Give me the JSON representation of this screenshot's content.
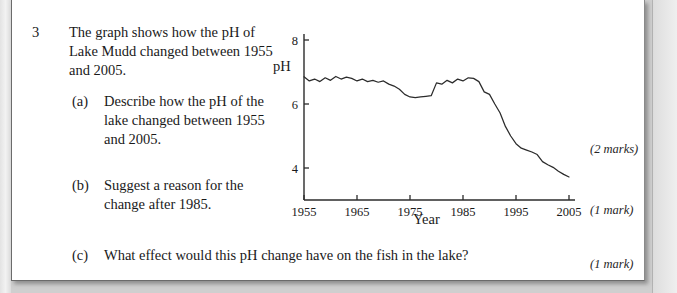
{
  "page": {
    "question_number": "3",
    "stem": "The graph shows how the pH of Lake Mudd changed between 1955 and 2005.",
    "parts": [
      {
        "label": "(a)",
        "text": "Describe how the pH of the lake changed between 1955 and 2005.",
        "marks": "(2 marks)"
      },
      {
        "label": "(b)",
        "text": "Suggest a reason for the change after 1985.",
        "marks": "(1 mark)"
      },
      {
        "label": "(c)",
        "text": "What effect would this pH change have on the fish in the lake?",
        "marks": "(1 mark)"
      }
    ]
  },
  "chart_data": {
    "type": "line",
    "title": "",
    "xlabel": "Year",
    "ylabel": "pH",
    "xlim": [
      1955,
      2005
    ],
    "ylim": [
      3,
      8
    ],
    "grid": false,
    "legend": null,
    "xticks": [
      1955,
      1965,
      1975,
      1985,
      1995,
      2005
    ],
    "xtick_labels": [
      "1955",
      "1965",
      "1975",
      "1985",
      "1995",
      "2005"
    ],
    "yticks": [
      4,
      6,
      8
    ],
    "ytick_labels": [
      "4",
      "6",
      "8"
    ],
    "series": [
      {
        "name": "pH of Lake Mudd",
        "x": [
          1955,
          1956,
          1957,
          1958,
          1959,
          1960,
          1961,
          1962,
          1963,
          1964,
          1965,
          1966,
          1967,
          1968,
          1969,
          1970,
          1971,
          1972,
          1973,
          1974,
          1975,
          1976,
          1977,
          1978,
          1979,
          1980,
          1981,
          1982,
          1983,
          1984,
          1985,
          1986,
          1987,
          1988,
          1989,
          1990,
          1991,
          1992,
          1993,
          1994,
          1995,
          1996,
          1997,
          1998,
          1999,
          2000,
          2001,
          2002,
          2003,
          2004,
          2005
        ],
        "values": [
          6.85,
          6.72,
          6.78,
          6.7,
          6.82,
          6.74,
          6.86,
          6.78,
          6.84,
          6.8,
          6.72,
          6.78,
          6.7,
          6.74,
          6.68,
          6.72,
          6.62,
          6.56,
          6.46,
          6.3,
          6.22,
          6.2,
          6.22,
          6.24,
          6.26,
          6.66,
          6.62,
          6.74,
          6.66,
          6.78,
          6.72,
          6.82,
          6.8,
          6.7,
          6.38,
          6.3,
          6.0,
          5.72,
          5.3,
          5.0,
          4.76,
          4.62,
          4.56,
          4.5,
          4.42,
          4.2,
          4.1,
          4.02,
          3.9,
          3.8,
          3.72
        ]
      }
    ]
  }
}
